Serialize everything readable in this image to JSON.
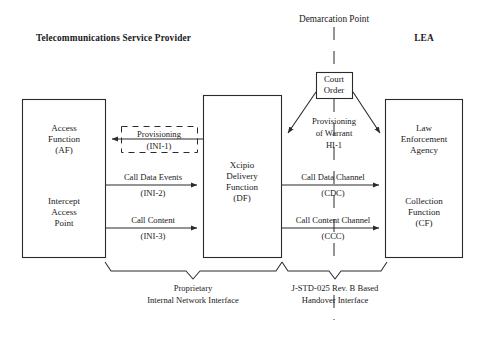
{
  "figure": {
    "type": "block-diagram",
    "title_left": "Telecommunications Service Provider",
    "title_right": "LEA",
    "demarcation_label": "Demarcation Point"
  },
  "boxes": {
    "access_function": {
      "line1": "Access",
      "line2": "Function",
      "line3": "(AF)",
      "sub1": "Intercept",
      "sub2": "Access",
      "sub3": "Point"
    },
    "delivery_function": {
      "line1": "Xcipio",
      "line2": "Delivery",
      "line3": "Function",
      "line4": "(DF)"
    },
    "law_enforcement": {
      "line1": "Law",
      "line2": "Enforcement",
      "line3": "Agency",
      "sub1": "Collection",
      "sub2": "Function",
      "sub3": "(CF)"
    },
    "court_order": {
      "line1": "Court",
      "line2": "Order"
    }
  },
  "flows": {
    "provisioning_ini1": {
      "label": "Provisioning",
      "code": "(INI-1)"
    },
    "call_data_events_ini2": {
      "label": "Call Data Events",
      "code": "(INI-2)"
    },
    "call_content_ini3": {
      "label": "Call Content",
      "code": "(INI-3)"
    },
    "provisioning_warrant": {
      "line1": "Provisioning",
      "line2": "of Warrant",
      "line3": "HI-1"
    },
    "call_data_channel": {
      "label": "Call Data Channel",
      "code": "(CDC)"
    },
    "call_content_channel": {
      "label": "Call Content Channel",
      "code": "(CCC)"
    }
  },
  "captions": {
    "left": {
      "line1": "Proprietary",
      "line2": "Internal Network Interface"
    },
    "right": {
      "line1": "J-STD-025 Rev. B Based",
      "line2": "Handover Interface"
    }
  },
  "colors": {
    "stroke": "#2b2b2b",
    "text": "#1a1a1a",
    "background": "#ffffff"
  }
}
